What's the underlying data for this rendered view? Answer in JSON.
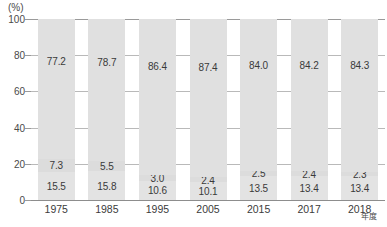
{
  "chart_data": {
    "type": "bar",
    "subtype": "stacked-100-percent",
    "title": "",
    "xlabel": "年度",
    "ylabel": "",
    "unit_label": "(%)",
    "ylim": [
      0,
      100
    ],
    "yticks": [
      0,
      20,
      40,
      60,
      80,
      100
    ],
    "ytick_labels": [
      "0",
      "20",
      "40",
      "60",
      "80",
      "100"
    ],
    "grid": true,
    "legend": "",
    "categories": [
      "1975",
      "1985",
      "1995",
      "2005",
      "2015",
      "2017",
      "2018"
    ],
    "series": [
      {
        "name": "bottom-segment",
        "stack_position": "bottom",
        "color": "#e3e3e3",
        "values": [
          15.5,
          15.8,
          10.6,
          10.1,
          13.5,
          13.4,
          13.4
        ],
        "labels": [
          "15.5",
          "15.8",
          "10.6",
          "10.1",
          "13.5",
          "13.4",
          "13.4"
        ]
      },
      {
        "name": "middle-segment",
        "stack_position": "middle",
        "color": "#dcdcdc",
        "values": [
          7.3,
          5.5,
          3.0,
          2.4,
          2.5,
          2.4,
          2.3
        ],
        "labels": [
          "7.3",
          "5.5",
          "3.0",
          "2.4",
          "2.5",
          "2.4",
          "2.3"
        ]
      },
      {
        "name": "top-segment",
        "stack_position": "top",
        "color": "#e0e0e0",
        "values": [
          77.2,
          78.7,
          86.4,
          87.4,
          84.0,
          84.2,
          84.3
        ],
        "labels": [
          "77.2",
          "78.7",
          "86.4",
          "87.4",
          "84.0",
          "84.2",
          "84.3"
        ]
      }
    ]
  },
  "axis": {
    "unit_label": "(%)",
    "x_axis_name": "年度"
  }
}
